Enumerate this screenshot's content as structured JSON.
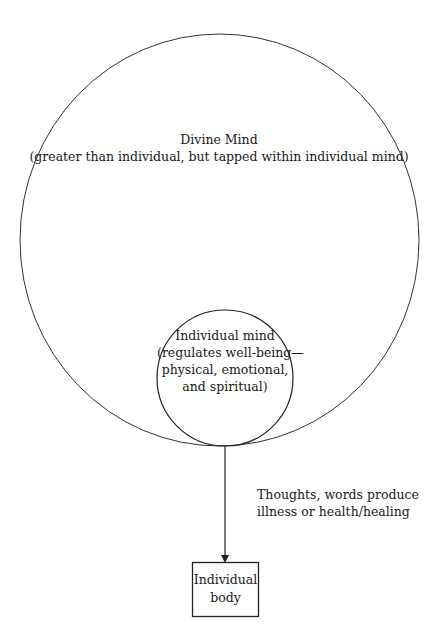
{
  "diagram": {
    "divine_mind": {
      "title": "Divine Mind",
      "subtitle": "(greater than individual, but tapped within individual mind)"
    },
    "individual_mind": {
      "lines": [
        "Individual mind",
        "(regulates well-being—",
        "physical, emotional,",
        "and spiritual)"
      ]
    },
    "connector": {
      "lines": [
        "Thoughts, words produce",
        "illness or health/healing"
      ]
    },
    "individual_body": {
      "lines": [
        "Individual",
        "body"
      ]
    },
    "colors": {
      "stroke": "#333333",
      "text": "#1a1a1a",
      "background": "#ffffff"
    }
  }
}
